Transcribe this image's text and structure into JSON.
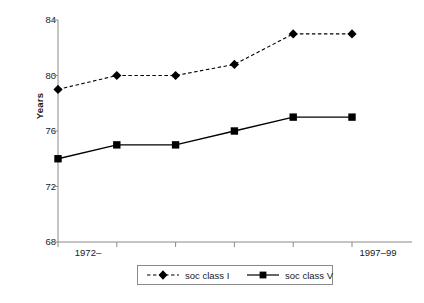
{
  "chart_data": {
    "type": "line",
    "title": "",
    "xlabel": "",
    "ylabel": "Years",
    "ylim": [
      68,
      84
    ],
    "yticks": [
      68,
      72,
      76,
      80,
      84
    ],
    "ytick_labels": [
      "68",
      "72",
      "76",
      "80",
      "84"
    ],
    "grid": false,
    "legend_position": "bottom",
    "x_positions": [
      0,
      1,
      2,
      3,
      4,
      5
    ],
    "categories": [
      "1972–",
      "",
      "",
      "",
      "",
      "1997–99"
    ],
    "xtick_labels_shown": [
      "1972–",
      "1997–99"
    ],
    "series": [
      {
        "name": "soc class I",
        "marker": "diamond",
        "linestyle": "dashed",
        "color": "#000000",
        "values": [
          79.0,
          80.0,
          80.0,
          80.8,
          83.0,
          83.0
        ]
      },
      {
        "name": "soc class V",
        "marker": "square",
        "linestyle": "solid",
        "color": "#000000",
        "values": [
          74.0,
          75.0,
          75.0,
          76.0,
          77.0,
          77.0
        ]
      }
    ]
  },
  "axis": {
    "y_title": "Years",
    "y_labels": [
      "84",
      "80",
      "76",
      "72",
      "68"
    ],
    "x_label_left": "1972–",
    "x_label_right": "1997–99"
  },
  "legend": {
    "items": [
      {
        "label": "soc class I",
        "marker": "diamond-marker-icon",
        "linestyle": "dashed"
      },
      {
        "label": "soc class V",
        "marker": "square-marker-icon",
        "linestyle": "solid"
      }
    ]
  },
  "colors": {
    "axis": "#8a8a8a",
    "series": "#000000",
    "legend_border": "#8a8a8a",
    "background": "#ffffff",
    "text": "#1a1a1a"
  }
}
